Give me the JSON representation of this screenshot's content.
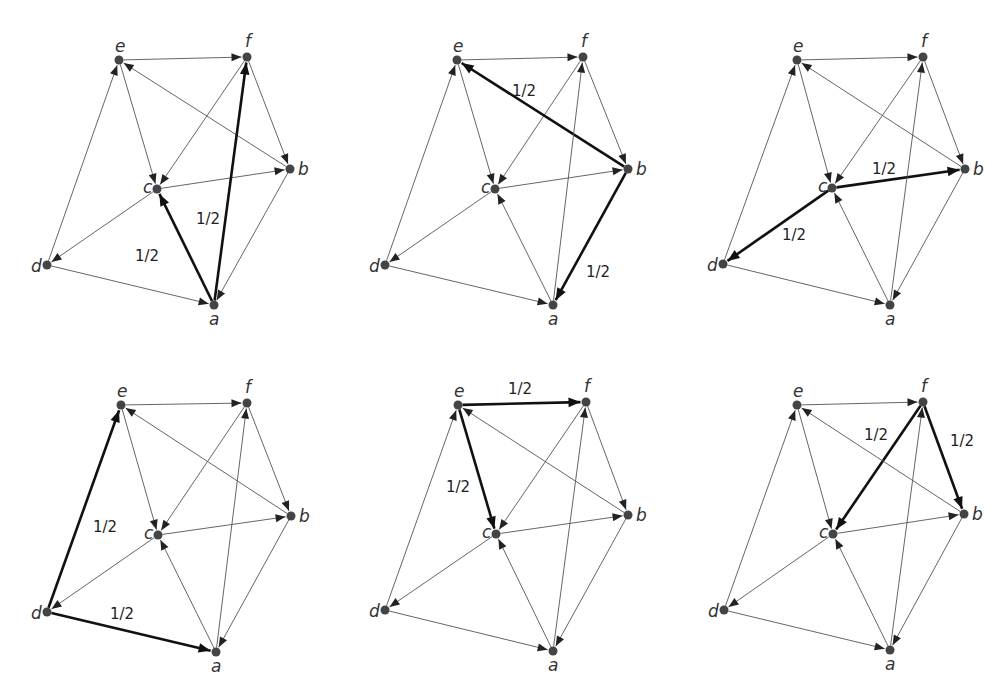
{
  "figure": {
    "colors": {
      "node": "#444444",
      "edge": "#555555",
      "bold_edge": "#111111",
      "label": "#333333",
      "background": "#ffffff"
    },
    "edges": [
      [
        "e",
        "f"
      ],
      [
        "e",
        "c"
      ],
      [
        "f",
        "c"
      ],
      [
        "f",
        "b"
      ],
      [
        "b",
        "e"
      ],
      [
        "b",
        "a"
      ],
      [
        "c",
        "b"
      ],
      [
        "c",
        "d"
      ],
      [
        "d",
        "e"
      ],
      [
        "d",
        "a"
      ],
      [
        "a",
        "c"
      ],
      [
        "a",
        "f"
      ]
    ],
    "panels": [
      {
        "id": "panel-a",
        "source_node": "a",
        "nodes": {
          "e": [
            119,
            60
          ],
          "f": [
            247,
            57
          ],
          "b": [
            290,
            169
          ],
          "c": [
            157,
            189
          ],
          "d": [
            47,
            265
          ],
          "a": [
            214,
            305
          ]
        },
        "bold_edges": [
          [
            "a",
            "c"
          ],
          [
            "a",
            "f"
          ]
        ],
        "weights": [
          {
            "text": "1/2",
            "x": 135,
            "y": 261
          },
          {
            "text": "1/2",
            "x": 196,
            "y": 224
          }
        ]
      },
      {
        "id": "panel-b",
        "source_node": "b",
        "nodes": {
          "e": [
            457,
            60
          ],
          "f": [
            583,
            57
          ],
          "b": [
            628,
            169
          ],
          "c": [
            495,
            189
          ],
          "d": [
            385,
            265
          ],
          "a": [
            553,
            305
          ]
        },
        "bold_edges": [
          [
            "b",
            "e"
          ],
          [
            "b",
            "a"
          ]
        ],
        "weights": [
          {
            "text": "1/2",
            "x": 512,
            "y": 96
          },
          {
            "text": "1/2",
            "x": 586,
            "y": 277
          }
        ]
      },
      {
        "id": "panel-c",
        "source_node": "c",
        "nodes": {
          "e": [
            797,
            60
          ],
          "f": [
            923,
            57
          ],
          "b": [
            965,
            169
          ],
          "c": [
            832,
            188
          ],
          "d": [
            723,
            264
          ],
          "a": [
            890,
            305
          ]
        },
        "bold_edges": [
          [
            "c",
            "b"
          ],
          [
            "c",
            "d"
          ]
        ],
        "weights": [
          {
            "text": "1/2",
            "x": 872,
            "y": 174
          },
          {
            "text": "1/2",
            "x": 782,
            "y": 240
          }
        ]
      },
      {
        "id": "panel-d",
        "source_node": "d",
        "nodes": {
          "e": [
            121,
            405
          ],
          "f": [
            247,
            403
          ],
          "b": [
            291,
            516
          ],
          "c": [
            158,
            535
          ],
          "d": [
            47,
            612
          ],
          "a": [
            216,
            652
          ]
        },
        "bold_edges": [
          [
            "d",
            "e"
          ],
          [
            "d",
            "a"
          ]
        ],
        "weights": [
          {
            "text": "1/2",
            "x": 93,
            "y": 532
          },
          {
            "text": "1/2",
            "x": 110,
            "y": 619
          }
        ]
      },
      {
        "id": "panel-e",
        "source_node": "e",
        "nodes": {
          "e": [
            458,
            405
          ],
          "f": [
            586,
            402
          ],
          "b": [
            628,
            515
          ],
          "c": [
            496,
            534
          ],
          "d": [
            385,
            610
          ],
          "a": [
            553,
            651
          ]
        },
        "bold_edges": [
          [
            "e",
            "f"
          ],
          [
            "e",
            "c"
          ]
        ],
        "weights": [
          {
            "text": "1/2",
            "x": 508,
            "y": 394
          },
          {
            "text": "1/2",
            "x": 446,
            "y": 492
          }
        ]
      },
      {
        "id": "panel-f",
        "source_node": "f",
        "nodes": {
          "e": [
            797,
            405
          ],
          "f": [
            923,
            402
          ],
          "b": [
            964,
            514
          ],
          "c": [
            833,
            534
          ],
          "d": [
            724,
            610
          ],
          "a": [
            890,
            650
          ]
        },
        "bold_edges": [
          [
            "f",
            "c"
          ],
          [
            "f",
            "b"
          ]
        ],
        "weights": [
          {
            "text": "1/2",
            "x": 864,
            "y": 440
          },
          {
            "text": "1/2",
            "x": 950,
            "y": 446
          }
        ]
      }
    ]
  }
}
